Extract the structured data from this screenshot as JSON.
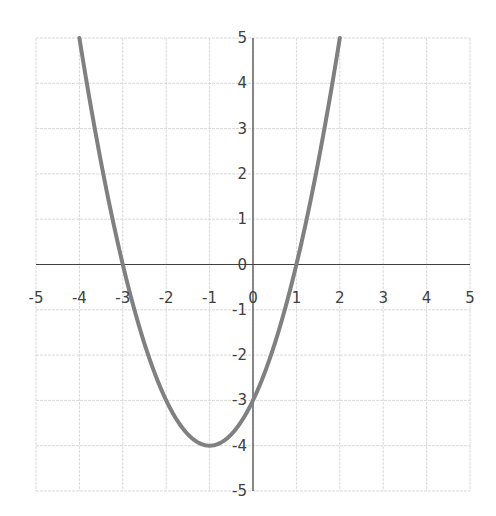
{
  "chart_data": {
    "type": "line",
    "title": "",
    "xlabel": "",
    "ylabel": "",
    "function": "y = x^2 + 2x - 3",
    "xlim": [
      -5,
      5
    ],
    "ylim": [
      -5,
      5
    ],
    "grid": true,
    "legend": null,
    "x_ticks": [
      "-5",
      "-4",
      "-3",
      "-2",
      "-1",
      "0",
      "1",
      "2",
      "3",
      "4",
      "5"
    ],
    "y_ticks": [
      "5",
      "4",
      "3",
      "2",
      "1",
      "0",
      "-1",
      "-2",
      "-3",
      "-4",
      "-5"
    ],
    "series": [
      {
        "name": "parabola",
        "color": "#808080",
        "x": [
          -4,
          -3.5,
          -3,
          -2.5,
          -2,
          -1.5,
          -1,
          -0.5,
          0,
          0.5,
          1,
          1.5,
          2
        ],
        "y": [
          5,
          2.25,
          0,
          -1.75,
          -3,
          -3.75,
          -4,
          -3.75,
          -3,
          -1.75,
          0,
          2.25,
          5
        ]
      }
    ],
    "annotations": {
      "vertex": [
        -1,
        -4
      ],
      "roots": [
        -3,
        1
      ],
      "y_intercept": -3
    }
  },
  "colors": {
    "curve": "#808080",
    "axis": "#404040",
    "grid": "#d9d9d9",
    "text": "#404040"
  }
}
